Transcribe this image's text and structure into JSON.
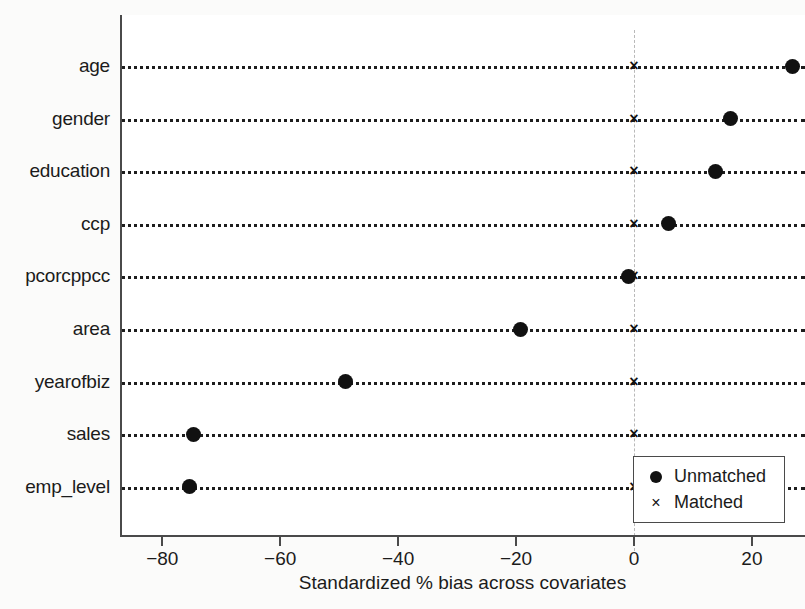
{
  "chart_data": {
    "type": "scatter",
    "title": "",
    "xlabel": "Standardized % bias across covariates",
    "ylabel": "",
    "xlim": [
      -87,
      29
    ],
    "xticks": [
      -80,
      -60,
      -40,
      -20,
      0,
      20
    ],
    "xtick_labels": [
      "-80",
      "-60",
      "-40",
      "-20",
      "0",
      "20"
    ],
    "grid": "dotted horizontal guide per category",
    "reference_line": 0,
    "legend_position": "lower right",
    "categories": [
      "age",
      "gender",
      "education",
      "ccp",
      "pcorcppcc",
      "area",
      "yearofbiz",
      "sales",
      "emp_level"
    ],
    "series": [
      {
        "name": "Unmatched",
        "marker": "circle",
        "color": "#111111",
        "values": [
          26.8,
          16.4,
          13.9,
          5.8,
          -0.9,
          -19.3,
          -49.0,
          -74.7,
          -75.3
        ]
      },
      {
        "name": "Matched",
        "marker": "x",
        "color": "#111111",
        "values": [
          0,
          0,
          0,
          0,
          0,
          0,
          0,
          0,
          0
        ]
      }
    ]
  },
  "legend": {
    "items": [
      {
        "label": "Unmatched",
        "marker": "circle-marker-icon"
      },
      {
        "label": "Matched",
        "marker": "cross-marker-icon"
      }
    ]
  }
}
